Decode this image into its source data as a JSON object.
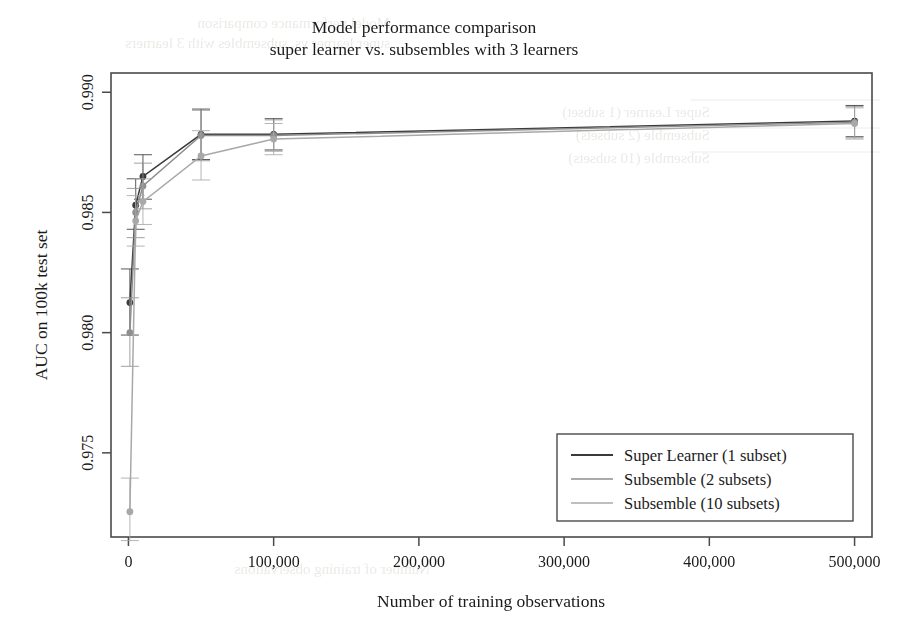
{
  "figure": {
    "title_line1": "Model performance comparison",
    "title_line2": "super learner vs. subsembles with 3 learners",
    "background": "#ffffff",
    "frame_color": "#4a4a4a"
  },
  "axes": {
    "xlabel": "Number of training observations",
    "ylabel": "AUC on 100k test set",
    "xticks": [
      "0",
      "100,000",
      "200,000",
      "300,000",
      "400,000",
      "500,000"
    ],
    "xtick_values": [
      0,
      100000,
      200000,
      300000,
      400000,
      500000
    ],
    "yticks": [
      "0.975",
      "0.980",
      "0.985",
      "0.990"
    ],
    "ytick_values": [
      0.975,
      0.98,
      0.985,
      0.99
    ],
    "xlim": [
      -12000,
      512000
    ],
    "ylim": [
      0.9715,
      0.9908
    ]
  },
  "legend": {
    "items": [
      {
        "label": "Super Learner (1 subset)",
        "color": "#3a3a3a"
      },
      {
        "label": "Subsemble (2 subsets)",
        "color": "#8f8f8f"
      },
      {
        "label": "Subsemble (10 subsets)",
        "color": "#a8a8a8"
      }
    ]
  },
  "ghost_text": {
    "top_line1": "Model performance comparison",
    "top_line2": "super learner vs. subsembles with 3 learners",
    "legend_line1": "Super Learner (1 subset)",
    "legend_line2": "Subsemble (2 subsets)",
    "legend_line3": "Subsemble (10 subsets)",
    "bottom_line": "Number of training observations"
  },
  "chart_data": {
    "type": "line",
    "title": "Model performance comparison\nsuper learner vs. subsembles with 3 learners",
    "xlabel": "Number of training observations",
    "ylabel": "AUC on 100k test set",
    "xlim": [
      -12000,
      512000
    ],
    "ylim": [
      0.9715,
      0.9908
    ],
    "grid": false,
    "legend_position": "lower right",
    "markers": "filled-circle",
    "errorbars": true,
    "x": [
      1000,
      5000,
      10000,
      50000,
      100000,
      500000
    ],
    "series": [
      {
        "name": "Super Learner (1 subset)",
        "color": "#3a3a3a",
        "values": [
          0.98125,
          0.9853,
          0.9865,
          0.98825,
          0.98825,
          0.9888
        ],
        "err_low": [
          0.9799,
          0.9843,
          0.98555,
          0.9872,
          0.9876,
          0.98815
        ],
        "err_high": [
          0.98265,
          0.9864,
          0.9874,
          0.9893,
          0.9889,
          0.98945
        ]
      },
      {
        "name": "Subsemble (2 subsets)",
        "color": "#8f8f8f",
        "values": [
          0.98,
          0.985,
          0.9861,
          0.9882,
          0.9882,
          0.98875
        ],
        "err_low": [
          0.9786,
          0.98395,
          0.98515,
          0.98715,
          0.98755,
          0.9881
        ],
        "err_high": [
          0.98145,
          0.986,
          0.98705,
          0.98925,
          0.98885,
          0.9894
        ]
      },
      {
        "name": "Subsemble (10 subsets)",
        "color": "#a8a8a8",
        "values": [
          0.97255,
          0.98465,
          0.98545,
          0.98735,
          0.98805,
          0.9887
        ],
        "err_low": [
          0.97135,
          0.9836,
          0.9845,
          0.98635,
          0.9874,
          0.98805
        ],
        "err_high": [
          0.97395,
          0.9857,
          0.9864,
          0.9884,
          0.9887,
          0.98935
        ]
      }
    ]
  }
}
